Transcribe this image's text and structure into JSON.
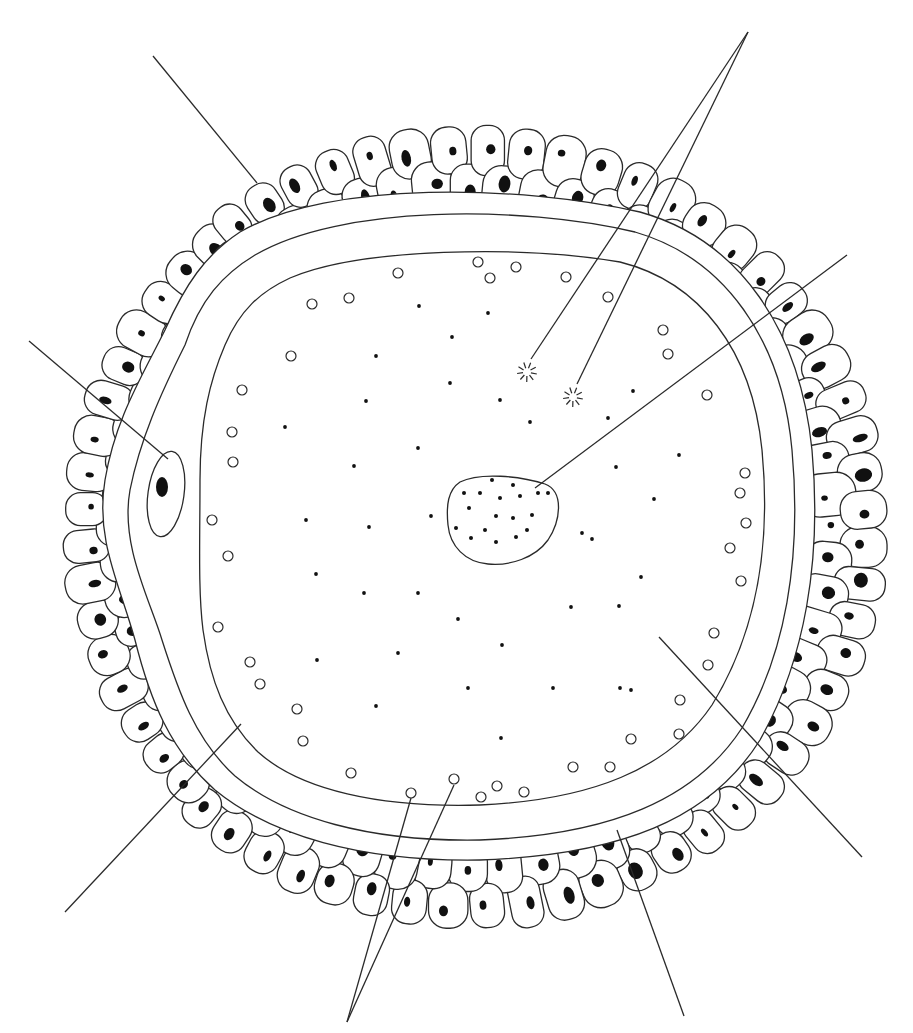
{
  "diagram": {
    "colors": {
      "line": "#2a2a2a",
      "fill": "#111111",
      "background": "#ffffff"
    },
    "structures": [
      {
        "id": "corona-radiata",
        "description": "outer layer of follicular cells with dark nuclei"
      },
      {
        "id": "zona-pellucida",
        "description": "thick clear band between two concentric outlines"
      },
      {
        "id": "perivitelline-space",
        "description": "narrow band inside zona"
      },
      {
        "id": "plasma-membrane",
        "description": "inner outline of the ooplasm"
      },
      {
        "id": "polar-body",
        "description": "small oval cell with dark nucleus at left, within zona"
      },
      {
        "id": "nucleus",
        "description": "irregular body with chromatin dots near center"
      },
      {
        "id": "cortical-granules",
        "description": "small open circles near the membrane"
      },
      {
        "id": "centrosome-particles",
        "description": "two star-shaped particles upper-center"
      },
      {
        "id": "cytoplasm-dots",
        "description": "small black dots scattered in the ooplasm"
      }
    ],
    "leader_lines": [
      {
        "target": "corona-radiata",
        "from": [
          153,
          56
        ],
        "to": [
          257,
          183
        ]
      },
      {
        "target": "polar-body",
        "from": [
          29,
          341
        ],
        "to": [
          168,
          459
        ]
      },
      {
        "target": "centrosome-a",
        "from": [
          748,
          32
        ],
        "to": [
          531,
          359
        ]
      },
      {
        "target": "centrosome-b",
        "from": [
          748,
          32
        ],
        "to": [
          577,
          384
        ]
      },
      {
        "target": "nucleus",
        "from": [
          847,
          255
        ],
        "to": [
          535,
          488
        ]
      },
      {
        "target": "cytoplasm",
        "from": [
          862,
          857
        ],
        "to": [
          659,
          637
        ]
      },
      {
        "target": "zona-pellucida",
        "from": [
          684,
          1016
        ],
        "to": [
          617,
          830
        ]
      },
      {
        "target": "cortical-granule-a",
        "from": [
          347,
          1022
        ],
        "to": [
          411,
          798
        ]
      },
      {
        "target": "cortical-granule-b",
        "from": [
          347,
          1022
        ],
        "to": [
          454,
          785
        ]
      },
      {
        "target": "perivitelline-space",
        "from": [
          65,
          912
        ],
        "to": [
          241,
          724
        ]
      }
    ],
    "label_texts": []
  }
}
